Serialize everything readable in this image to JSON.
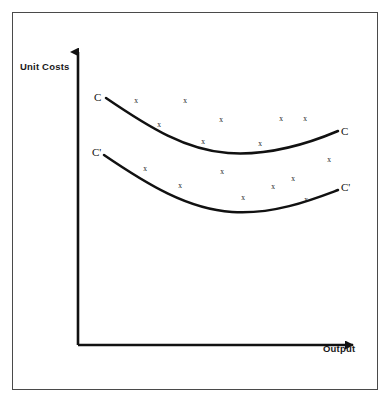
{
  "figure": {
    "background_color": "#ffffff",
    "border_color": "#4a4a4a",
    "ink_color": "#111111"
  },
  "axes": {
    "y_label": "Unit Costs",
    "x_label": "Output",
    "y_arrow_icon": "arrow-up-icon",
    "x_arrow_icon": "arrow-right-icon"
  },
  "labels": {
    "c_left": "C",
    "c_right": "C",
    "c_prime_left": "C'",
    "c_prime_right": "C'",
    "marker_glyph": "x"
  },
  "chart_data": {
    "type": "scatter",
    "title": "",
    "subtitle": "",
    "xlabel": "Output",
    "ylabel": "Unit Costs",
    "xlim": [
      0,
      100
    ],
    "ylim": [
      0,
      100
    ],
    "grid": false,
    "legend": "inline-curve-end-labels",
    "axis_ticks": [],
    "series": [
      {
        "name": "C",
        "kind": "curve",
        "label_left": "C",
        "label_right": "C",
        "points": [
          {
            "x": 8,
            "y": 82
          },
          {
            "x": 20,
            "y": 72
          },
          {
            "x": 34,
            "y": 65
          },
          {
            "x": 50,
            "y": 61
          },
          {
            "x": 66,
            "y": 62
          },
          {
            "x": 82,
            "y": 67
          },
          {
            "x": 94,
            "y": 73
          }
        ]
      },
      {
        "name": "C'",
        "kind": "curve",
        "label_left": "C'",
        "label_right": "C'",
        "points": [
          {
            "x": 8,
            "y": 64
          },
          {
            "x": 20,
            "y": 55
          },
          {
            "x": 34,
            "y": 48
          },
          {
            "x": 50,
            "y": 44
          },
          {
            "x": 66,
            "y": 45
          },
          {
            "x": 82,
            "y": 50
          },
          {
            "x": 94,
            "y": 55
          }
        ]
      },
      {
        "name": "Observations around C",
        "kind": "scatter",
        "marker": "x",
        "points": [
          {
            "x": 21,
            "y": 84
          },
          {
            "x": 39,
            "y": 84
          },
          {
            "x": 29,
            "y": 75
          },
          {
            "x": 52,
            "y": 77
          },
          {
            "x": 76,
            "y": 77
          },
          {
            "x": 85,
            "y": 77
          },
          {
            "x": 45,
            "y": 69
          },
          {
            "x": 66,
            "y": 69
          }
        ]
      },
      {
        "name": "Observations around C'",
        "kind": "scatter",
        "marker": "x",
        "points": [
          {
            "x": 24,
            "y": 60
          },
          {
            "x": 51,
            "y": 59
          },
          {
            "x": 88,
            "y": 56
          },
          {
            "x": 72,
            "y": 52
          },
          {
            "x": 33,
            "y": 48
          },
          {
            "x": 62,
            "y": 48
          },
          {
            "x": 47,
            "y": 45
          },
          {
            "x": 79,
            "y": 45
          }
        ]
      }
    ],
    "markers_px": [
      {
        "group": "C",
        "x": 136,
        "y": 100
      },
      {
        "group": "C",
        "x": 185,
        "y": 100
      },
      {
        "group": "C",
        "x": 159,
        "y": 124
      },
      {
        "group": "C",
        "x": 221,
        "y": 119
      },
      {
        "group": "C",
        "x": 281,
        "y": 118
      },
      {
        "group": "C",
        "x": 305,
        "y": 118
      },
      {
        "group": "C",
        "x": 203,
        "y": 141
      },
      {
        "group": "C",
        "x": 260,
        "y": 143
      },
      {
        "group": "Cp",
        "x": 145,
        "y": 168
      },
      {
        "group": "Cp",
        "x": 222,
        "y": 171
      },
      {
        "group": "Cp",
        "x": 329,
        "y": 159
      },
      {
        "group": "Cp",
        "x": 293,
        "y": 178
      },
      {
        "group": "Cp",
        "x": 180,
        "y": 185
      },
      {
        "group": "Cp",
        "x": 273,
        "y": 186
      },
      {
        "group": "Cp",
        "x": 243,
        "y": 197
      },
      {
        "group": "Cp",
        "x": 306,
        "y": 199
      }
    ],
    "curves_px": {
      "C": "M 106,98 C 150,128 186,150 228,153 C 270,156 312,142 338,131",
      "Cp": "M 104,155 C 148,185 188,209 232,212 C 274,215 314,199 338,190"
    },
    "axis_px": {
      "origin": {
        "x": 78,
        "y": 345
      },
      "y_top": {
        "x": 78,
        "y": 46
      },
      "x_right": {
        "x": 360,
        "y": 345
      }
    }
  }
}
